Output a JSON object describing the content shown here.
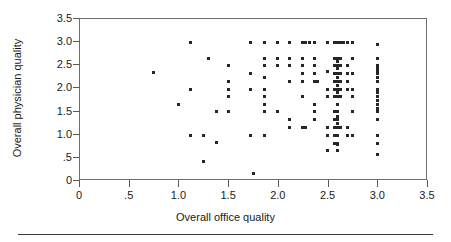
{
  "chart_data": {
    "type": "scatter",
    "title": "",
    "xlabel": "Overall office quality",
    "ylabel": "Overall physician quality",
    "xlim": [
      0,
      3.5
    ],
    "ylim": [
      0,
      3.5
    ],
    "xticks": [
      0,
      0.5,
      1.0,
      1.5,
      2.0,
      2.5,
      3.0,
      3.5
    ],
    "xtick_labels": [
      "0",
      ".5",
      "1.0",
      "1.5",
      "2.0",
      "2.5",
      "3.0",
      "3.5"
    ],
    "yticks": [
      0,
      0.5,
      1.0,
      1.5,
      2.0,
      2.5,
      3.0,
      3.5
    ],
    "ytick_labels": [
      "0",
      ".5",
      "1.0",
      "1.5",
      "2.0",
      "2.5",
      "3.0",
      "3.5"
    ],
    "grid": false,
    "legend": null,
    "marker": "square",
    "marker_color": "#262626",
    "marker_size_px": 3,
    "frame_color": "#6e6e6e",
    "background": "#ffffff",
    "n_points": 169,
    "points": [
      [
        0.75,
        2.32
      ],
      [
        1.0,
        1.64
      ],
      [
        1.12,
        2.96
      ],
      [
        1.12,
        1.96
      ],
      [
        1.12,
        0.97
      ],
      [
        1.25,
        0.97
      ],
      [
        1.25,
        0.39
      ],
      [
        1.3,
        2.62
      ],
      [
        1.38,
        1.47
      ],
      [
        1.38,
        0.81
      ],
      [
        1.5,
        2.47
      ],
      [
        1.5,
        2.12
      ],
      [
        1.5,
        1.96
      ],
      [
        1.5,
        1.8
      ],
      [
        1.5,
        1.47
      ],
      [
        1.72,
        2.96
      ],
      [
        1.72,
        2.3
      ],
      [
        1.72,
        1.96
      ],
      [
        1.72,
        0.97
      ],
      [
        1.75,
        0.15
      ],
      [
        1.87,
        2.96
      ],
      [
        1.87,
        2.62
      ],
      [
        1.87,
        2.47
      ],
      [
        1.87,
        2.21
      ],
      [
        1.87,
        1.96
      ],
      [
        1.87,
        1.8
      ],
      [
        1.87,
        1.63
      ],
      [
        1.87,
        1.47
      ],
      [
        1.87,
        0.97
      ],
      [
        2.0,
        2.96
      ],
      [
        2.0,
        2.62
      ],
      [
        2.0,
        2.47
      ],
      [
        2.0,
        1.47
      ],
      [
        2.12,
        2.96
      ],
      [
        2.12,
        2.62
      ],
      [
        2.12,
        2.47
      ],
      [
        2.12,
        2.12
      ],
      [
        2.12,
        1.3
      ],
      [
        2.12,
        1.14
      ],
      [
        2.25,
        2.96
      ],
      [
        2.25,
        2.62
      ],
      [
        2.25,
        2.47
      ],
      [
        2.25,
        2.3
      ],
      [
        2.25,
        2.12
      ],
      [
        2.25,
        1.8
      ],
      [
        2.25,
        1.14
      ],
      [
        2.28,
        2.96
      ],
      [
        2.28,
        1.14
      ],
      [
        2.32,
        2.96
      ],
      [
        2.37,
        2.96
      ],
      [
        2.37,
        2.62
      ],
      [
        2.37,
        2.47
      ],
      [
        2.37,
        2.3
      ],
      [
        2.37,
        2.12
      ],
      [
        2.37,
        2.12
      ],
      [
        2.37,
        1.63
      ],
      [
        2.37,
        1.47
      ],
      [
        2.37,
        1.3
      ],
      [
        2.4,
        2.12
      ],
      [
        2.5,
        2.96
      ],
      [
        2.5,
        2.35
      ],
      [
        2.5,
        1.96
      ],
      [
        2.5,
        1.8
      ],
      [
        2.5,
        1.14
      ],
      [
        2.5,
        0.97
      ],
      [
        2.5,
        0.63
      ],
      [
        2.57,
        2.96
      ],
      [
        2.57,
        2.62
      ],
      [
        2.57,
        2.47
      ],
      [
        2.57,
        2.3
      ],
      [
        2.57,
        2.12
      ],
      [
        2.57,
        1.96
      ],
      [
        2.57,
        1.8
      ],
      [
        2.57,
        1.47
      ],
      [
        2.57,
        1.3
      ],
      [
        2.57,
        1.14
      ],
      [
        2.57,
        0.97
      ],
      [
        2.57,
        0.79
      ],
      [
        2.6,
        2.96
      ],
      [
        2.6,
        2.62
      ],
      [
        2.6,
        2.55
      ],
      [
        2.6,
        2.47
      ],
      [
        2.6,
        2.4
      ],
      [
        2.6,
        2.3
      ],
      [
        2.6,
        2.21
      ],
      [
        2.6,
        2.12
      ],
      [
        2.6,
        2.05
      ],
      [
        2.6,
        1.96
      ],
      [
        2.6,
        1.88
      ],
      [
        2.6,
        1.8
      ],
      [
        2.6,
        1.63
      ],
      [
        2.6,
        1.47
      ],
      [
        2.6,
        1.38
      ],
      [
        2.6,
        1.3
      ],
      [
        2.6,
        1.22
      ],
      [
        2.6,
        1.14
      ],
      [
        2.6,
        0.97
      ],
      [
        2.6,
        0.79
      ],
      [
        2.6,
        0.76
      ],
      [
        2.6,
        0.63
      ],
      [
        2.63,
        2.96
      ],
      [
        2.63,
        2.62
      ],
      [
        2.63,
        2.47
      ],
      [
        2.63,
        2.3
      ],
      [
        2.63,
        2.12
      ],
      [
        2.63,
        1.96
      ],
      [
        2.63,
        1.8
      ],
      [
        2.63,
        1.14
      ],
      [
        2.66,
        2.96
      ],
      [
        2.7,
        2.96
      ],
      [
        2.7,
        2.47
      ],
      [
        2.7,
        2.3
      ],
      [
        2.7,
        2.12
      ],
      [
        2.7,
        1.96
      ],
      [
        2.7,
        1.14
      ],
      [
        2.7,
        0.97
      ],
      [
        2.75,
        2.96
      ],
      [
        2.75,
        2.62
      ],
      [
        2.75,
        2.3
      ],
      [
        2.75,
        1.96
      ],
      [
        2.75,
        1.8
      ],
      [
        2.75,
        1.47
      ],
      [
        2.75,
        0.97
      ],
      [
        3.0,
        2.93
      ],
      [
        3.0,
        2.62
      ],
      [
        3.0,
        2.47
      ],
      [
        3.0,
        2.4
      ],
      [
        3.0,
        2.35
      ],
      [
        3.0,
        2.3
      ],
      [
        3.0,
        2.21
      ],
      [
        3.0,
        2.12
      ],
      [
        3.0,
        1.96
      ],
      [
        3.0,
        1.88
      ],
      [
        3.0,
        1.8
      ],
      [
        3.0,
        1.72
      ],
      [
        3.0,
        1.63
      ],
      [
        3.0,
        1.55
      ],
      [
        3.0,
        1.47
      ],
      [
        3.0,
        1.3
      ],
      [
        3.0,
        0.97
      ],
      [
        3.0,
        0.79
      ],
      [
        3.0,
        0.55
      ]
    ]
  },
  "axes": {
    "x_title": "Overall office quality",
    "y_title": "Overall physician quality"
  }
}
